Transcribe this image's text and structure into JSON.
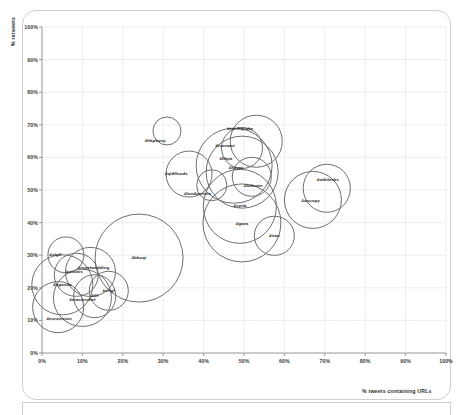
{
  "chart_data": {
    "type": "scatter",
    "title": "",
    "xlabel": "% tweets containing URLs",
    "ylabel": "% retweets",
    "xlim": [
      0,
      100
    ],
    "ylim": [
      0,
      100
    ],
    "grid": true,
    "legend": "none",
    "xticks": [
      "0%",
      "10%",
      "20%",
      "30%",
      "40%",
      "50%",
      "60%",
      "70%",
      "80%",
      "90%",
      "100%"
    ],
    "yticks": [
      "0%",
      "10%",
      "20%",
      "30%",
      "40%",
      "50%",
      "60%",
      "70%",
      "80%",
      "90%",
      "100%"
    ],
    "xtick_values": [
      0,
      10,
      20,
      30,
      40,
      50,
      60,
      70,
      80,
      90,
      100
    ],
    "ytick_values": [
      0,
      10,
      20,
      30,
      40,
      50,
      60,
      70,
      80,
      90,
      100
    ],
    "marker_style": "open-circle",
    "marker_color": "#6e6e6e",
    "size_encoding": "bubble radius encodes volume",
    "points": [
      {
        "label": "#hkpkony",
        "x": 31.0,
        "y": 68.0,
        "r": 3.6
      },
      {
        "label": "#earthquake",
        "x": 53.0,
        "y": 65.0,
        "r": 6.5
      },
      {
        "label": "#tsunami",
        "x": 49.5,
        "y": 63.0,
        "r": 5.2
      },
      {
        "label": "#egypt",
        "x": 47.5,
        "y": 57.5,
        "r": 9.5
      },
      {
        "label": "#libya",
        "x": 49.5,
        "y": 55.5,
        "r": 9.0
      },
      {
        "label": "#qldfloods",
        "x": 36.5,
        "y": 55.0,
        "r": 5.8
      },
      {
        "label": "#bahrain",
        "x": 52.0,
        "y": 54.0,
        "r": 5.0
      },
      {
        "label": "#londonriots",
        "x": 42.0,
        "y": 51.5,
        "r": 3.9
      },
      {
        "label": "#wikileaks",
        "x": 70.5,
        "y": 50.5,
        "r": 6.0
      },
      {
        "label": "#occupy",
        "x": 67.0,
        "y": 47.0,
        "r": 7.2
      },
      {
        "label": "#syria",
        "x": 49.0,
        "y": 45.0,
        "r": 9.2
      },
      {
        "label": "#gaza",
        "x": 49.5,
        "y": 40.0,
        "r": 9.8
      },
      {
        "label": "#iran",
        "x": 57.5,
        "y": 36.0,
        "r": 5.0
      },
      {
        "label": "#sfgif",
        "x": 6.0,
        "y": 30.0,
        "r": 4.6
      },
      {
        "label": "#bbcqt",
        "x": 24.0,
        "y": 29.0,
        "r": 11.0
      },
      {
        "label": "#royalwedding",
        "x": 12.0,
        "y": 25.0,
        "r": 6.2
      },
      {
        "label": "#oscars",
        "x": 8.5,
        "y": 24.0,
        "r": 5.5
      },
      {
        "label": "#uganda",
        "x": 5.0,
        "y": 21.0,
        "r": 7.6
      },
      {
        "label": "#xrlgf",
        "x": 16.5,
        "y": 19.0,
        "r": 5.0
      },
      {
        "label": "#tlf",
        "x": 13.0,
        "y": 17.5,
        "r": 5.4
      },
      {
        "label": "#masterchef",
        "x": 10.0,
        "y": 17.0,
        "r": 7.2
      },
      {
        "label": "#eurovision",
        "x": 4.0,
        "y": 14.0,
        "r": 6.4
      }
    ],
    "label_offsets": [
      {
        "label": "#hkpkony",
        "dx": -12,
        "dy": 10
      },
      {
        "label": "#earthquake",
        "dx": -16,
        "dy": -12
      },
      {
        "label": "#tsunami",
        "dx": -17,
        "dy": -2
      },
      {
        "label": "#egypt",
        "dx": 2,
        "dy": 2
      },
      {
        "label": "#libya",
        "dx": -16,
        "dy": -13
      },
      {
        "label": "#qldfloods",
        "dx": -13,
        "dy": 0
      },
      {
        "label": "#bahrain",
        "dx": 1,
        "dy": 9
      },
      {
        "label": "#londonriots",
        "dx": -14,
        "dy": 9
      },
      {
        "label": "#wikileaks",
        "dx": 1,
        "dy": -8
      },
      {
        "label": "#occupy",
        "dx": -2,
        "dy": 1
      },
      {
        "label": "#syria",
        "dx": 0,
        "dy": 0
      },
      {
        "label": "#gaza",
        "dx": 0,
        "dy": 1
      },
      {
        "label": "#iran",
        "dx": 0,
        "dy": 0
      },
      {
        "label": "#sfgif",
        "dx": -11,
        "dy": 0
      },
      {
        "label": "#bbcqt",
        "dx": 0,
        "dy": 0
      },
      {
        "label": "#royalwedding",
        "dx": 3,
        "dy": -4
      },
      {
        "label": "#oscars",
        "dx": -2,
        "dy": -3
      },
      {
        "label": "#uganda",
        "dx": 0,
        "dy": 0
      },
      {
        "label": "#xrlgf",
        "dx": 0,
        "dy": 0
      },
      {
        "label": "#tlf",
        "dx": 0,
        "dy": 0
      },
      {
        "label": "#masterchef",
        "dx": 0,
        "dy": 2
      },
      {
        "label": "#eurovision",
        "dx": 1,
        "dy": 12
      }
    ]
  }
}
